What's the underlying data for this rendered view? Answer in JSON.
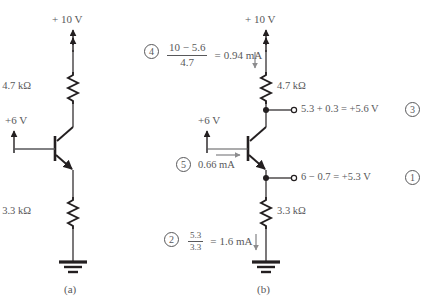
{
  "figure": {
    "background_color": "#ffffff",
    "ink_color": "#231f20",
    "text_color": "#58585a",
    "current_arrow_color": "#8c8c8e",
    "captions": [
      {
        "key": "a",
        "label": "(a)"
      },
      {
        "key": "b",
        "label": "(b)"
      }
    ]
  },
  "circuit_a": {
    "supply_top_label": "+ 10 V",
    "collector_resistor_label": "4.7 kΩ",
    "base_supply_label": "+6 V",
    "emitter_resistor_label": "3.3 kΩ",
    "transistor_type": "npn",
    "ground": "earth-ground"
  },
  "circuit_b": {
    "supply_top_label": "+ 10 V",
    "collector_resistor_label": "4.7 kΩ",
    "base_supply_label": "+6 V",
    "emitter_resistor_label": "3.3 kΩ",
    "transistor_type": "npn",
    "ground": "earth-ground",
    "node_collector_label": "5.3 + 0.3 = +5.6 V",
    "node_emitter_label": "6 − 0.7 = +5.3 V"
  },
  "annotations": [
    {
      "id": "step-4",
      "number": "4",
      "kind": "fraction-equation",
      "numerator": "10 − 5.6",
      "denominator": "4.7",
      "equals": "=",
      "result": "0.94 mA",
      "current_arrow": "down",
      "describes": "collector-current-through-4.7k"
    },
    {
      "id": "step-5",
      "number": "5",
      "kind": "value",
      "result": "0.66 mA",
      "current_arrow": "right",
      "describes": "base-current"
    },
    {
      "id": "step-2",
      "number": "2",
      "kind": "fraction-equation",
      "numerator": "5.3",
      "denominator": "3.3",
      "equals": "=",
      "result": "1.6 mA",
      "current_arrow": "down",
      "describes": "emitter-current-through-3.3k"
    },
    {
      "id": "step-3",
      "number": "3",
      "kind": "node-voltage",
      "expression": "5.3 + 0.3 = +5.6 V",
      "describes": "collector-node-voltage"
    },
    {
      "id": "step-1",
      "number": "1",
      "kind": "node-voltage",
      "expression": "6 − 0.7 = +5.3 V",
      "describes": "emitter-node-voltage"
    }
  ]
}
